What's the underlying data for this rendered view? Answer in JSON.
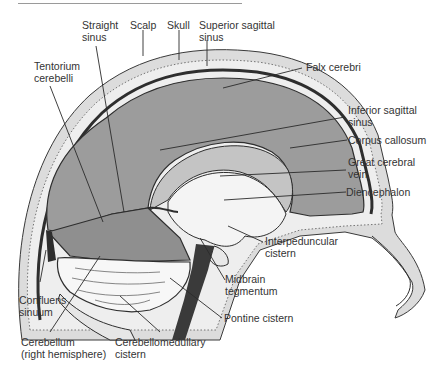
{
  "figure": {
    "labels": {
      "straight_sinus": [
        "Straight",
        "sinus"
      ],
      "scalp": [
        "Scalp"
      ],
      "skull": [
        "Skull"
      ],
      "superior_sagittal_sinus": [
        "Superior sagittal",
        "sinus"
      ],
      "tentorium_cerebelli": [
        "Tentorium",
        "cerebelli"
      ],
      "falx_cerebri": [
        "Falx cerebri"
      ],
      "inferior_sagittal_sinus": [
        "Inferior sagittal",
        "sinus"
      ],
      "corpus_callosum": [
        "Corpus callosum"
      ],
      "great_cerebral_vein": [
        "Great cerebral",
        "vein"
      ],
      "diencephalon": [
        "Diencephalon"
      ],
      "interpeduncular_cistern": [
        "Interpeduncular",
        "cistern"
      ],
      "midbrain_tegmentum": [
        "Midbrain",
        "tegmentum"
      ],
      "pontine_cistern": [
        "Pontine cistern"
      ],
      "confluens_sinuum": [
        "Confluens",
        "sinuum"
      ],
      "cerebellum": [
        "Cerebellum",
        "(right hemisphere)"
      ],
      "cerebellomedullary_cistern": [
        "Cerebellomedullary",
        "cistern"
      ]
    },
    "colors": {
      "falx_gray": "#9c9c9c",
      "tentorium_gray": "#8f8f8f",
      "scalp_light": "#d9d9d9",
      "sinus_dark": "#3a3a3a",
      "brain_white": "#f4f4f4",
      "corpus_callosum_gray": "#c4c4c4",
      "label_text": "#333333"
    }
  }
}
